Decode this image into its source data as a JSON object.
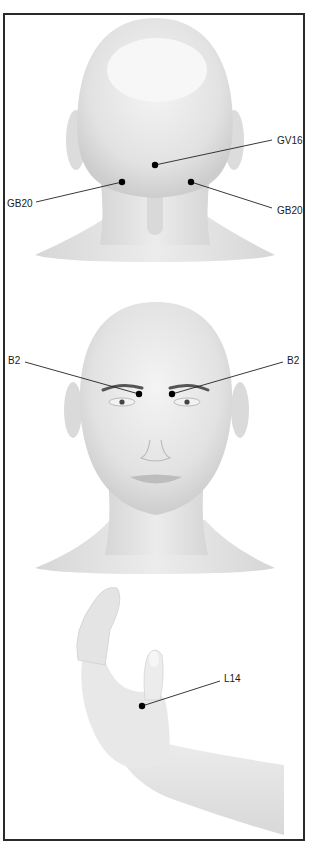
{
  "figure": {
    "panels": [
      {
        "id": "back-of-head",
        "view": "posterior head and neck",
        "points": [
          {
            "label": "GV16",
            "side": "right-label"
          },
          {
            "label": "GB20",
            "side": "left-label"
          },
          {
            "label": "GB20",
            "side": "right-label"
          }
        ]
      },
      {
        "id": "face",
        "view": "anterior head",
        "points": [
          {
            "label": "B2",
            "side": "left-label"
          },
          {
            "label": "B2",
            "side": "right-label"
          }
        ]
      },
      {
        "id": "hand",
        "view": "hand and forearm",
        "points": [
          {
            "label": "L14",
            "side": "right-label"
          }
        ]
      }
    ]
  },
  "colors": {
    "frame": "#2a2a2a",
    "skin": "#e6e6e6",
    "skin_shade": "#cfcfcf",
    "point": "#000000",
    "leader": "#222222"
  }
}
